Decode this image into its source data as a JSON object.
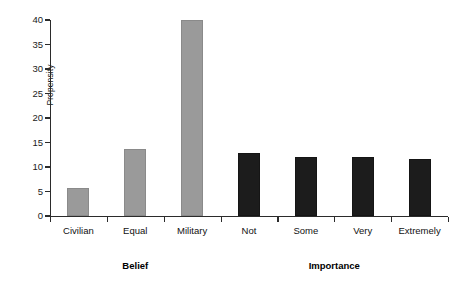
{
  "chart_data": {
    "type": "bar",
    "title": "",
    "xlabel": "",
    "ylabel": "Propensity",
    "ylim": [
      0,
      40
    ],
    "yticks": [
      0,
      5,
      10,
      15,
      20,
      25,
      30,
      35,
      40
    ],
    "ytick_labels": [
      "0",
      "5",
      "10",
      "15",
      "20",
      "25",
      "30",
      "35",
      "40"
    ],
    "grid": false,
    "legend": "none",
    "categories": [
      "Civilian",
      "Equal",
      "Military",
      "Not",
      "Some",
      "Very",
      "Extremely"
    ],
    "values": [
      5.7,
      13.7,
      40.0,
      12.8,
      12.0,
      12.1,
      11.7
    ],
    "bar_colors": [
      "#9a9a9a",
      "#9a9a9a",
      "#9a9a9a",
      "#1c1c1c",
      "#1c1c1c",
      "#1c1c1c",
      "#1c1c1c"
    ],
    "groups": [
      {
        "label": "Belief",
        "categories": [
          "Civilian",
          "Equal",
          "Military"
        ],
        "color": "#9a9a9a"
      },
      {
        "label": "Importance",
        "categories": [
          "Not",
          "Some",
          "Very",
          "Extremely"
        ],
        "color": "#1c1c1c"
      }
    ]
  },
  "axes": {
    "y_title": "Propensity",
    "y_labels": [
      "40",
      "35",
      "30",
      "25",
      "20",
      "15",
      "10",
      "5",
      "0"
    ],
    "x_labels": [
      "Civilian",
      "Equal",
      "Military",
      "Not",
      "Some",
      "Very",
      "Extremely"
    ]
  },
  "group_labels": {
    "belief": "Belief",
    "importance": "Importance"
  },
  "colors": {
    "light_bar": "#9a9a9a",
    "dark_bar": "#1c1c1c",
    "axis": "#2b2b2b",
    "background": "#ffffff"
  }
}
